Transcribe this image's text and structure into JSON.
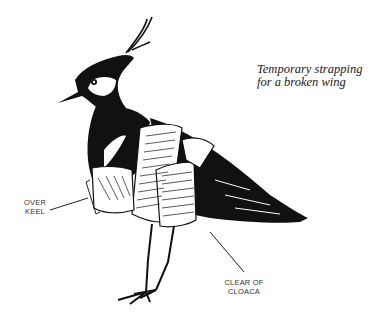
{
  "caption": "Temporary strapping for a broken wing",
  "labels": {
    "over_keel_line1": "OVER",
    "over_keel_line2": "KEEL",
    "clear_of_cloaca_line1": "CLEAR OF",
    "clear_of_cloaca_line2": "CLOACA"
  },
  "illustration": {
    "subject": "lapwing-bird",
    "ink_color": "#111111",
    "background": "#ffffff"
  }
}
